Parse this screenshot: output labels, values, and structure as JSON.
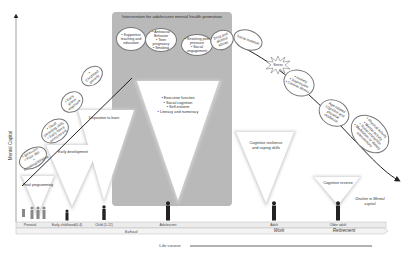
{
  "axes": {
    "y_label": "Mental Capital",
    "x_label": "Life course"
  },
  "promotion_box": {
    "title": "Intervention for adolescent mental health promotion"
  },
  "rising_bubbles": [
    {
      "text": "• Stressors\n• Poor diet\n• Smoking/drinking"
    },
    {
      "text": "• Good parenting skills\n• Early home environment"
    },
    {
      "text": "• Early stress exposure"
    },
    {
      "text": "• Childhood poverty"
    },
    {
      "text": "• Supportive teaching and education"
    },
    {
      "text": "• Antisocial Behavior\n• Teen pregnancy\n• Smoking"
    },
    {
      "text": "• Resisting peer pressure\n• Social engagement"
    },
    {
      "text": "Drug and alcohol abuse"
    },
    {
      "text": "Social isolation"
    }
  ],
  "declining_bubbles": [
    {
      "text": "• Anxiety\n• Depression\n• Chronic illness"
    },
    {
      "text": "Age-related cognitive and physical resilience"
    },
    {
      "text": "• Physical activity\n• Mental activity\n• Social interaction\n• Medication or dietary interventions"
    }
  ],
  "starburst": {
    "text": "Stress"
  },
  "triangles": [
    {
      "label": "Fetal programming"
    },
    {
      "label": "Early development"
    },
    {
      "label": "Disposition to learn"
    },
    {
      "label": "• Executive function\n• Social cognition\n• Self-esteem\n• Literacy and numeracy"
    },
    {
      "label": "Cognitive resilience and coping skills"
    },
    {
      "label": "Cognitive reserve"
    }
  ],
  "decline_label": "Decline in Mental capital",
  "stages": [
    {
      "label": "Prenatal"
    },
    {
      "label": "Early childhood(0-4)"
    },
    {
      "label": "Child (5-12)"
    },
    {
      "label": "Adolescent"
    },
    {
      "label": "Adult"
    },
    {
      "label": "Older adult"
    }
  ],
  "timeline": {
    "school": "School",
    "work": "Work",
    "retirement": "Retirement"
  },
  "colors": {
    "promo_box": "#b9b9b9",
    "line": "#222222",
    "triangle": "#ffffff"
  }
}
